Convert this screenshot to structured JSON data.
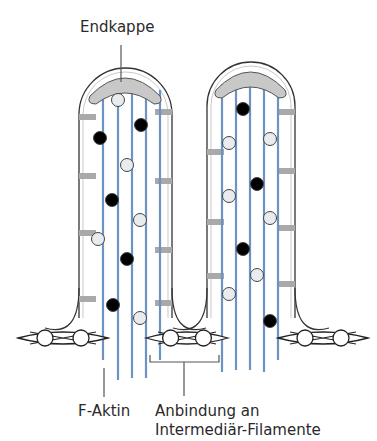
{
  "figure": {
    "type": "Mikrovilli schematic",
    "labels": {
      "top": "Endkappe",
      "bottom_left": "F-Aktin",
      "bottom_right_line1": "Anbindung an",
      "bottom_right_line2": "Intermediär-Filamente"
    }
  },
  "colors": {
    "outline": "#333333",
    "filament": "#6b93c4",
    "crosslink": "#a9a9a9",
    "cap": "#c8c8c8",
    "dot_filled": "#000000",
    "dot_open_fill": "#e8ecef",
    "leader": "#555555"
  },
  "villi": [
    {
      "name": "left-villus",
      "x_left": 79,
      "x_right": 172,
      "top": 68,
      "base": 318,
      "filaments_x": [
        103,
        118,
        132,
        146,
        160
      ],
      "filament_bottom": [
        360,
        380,
        378,
        378,
        360
      ],
      "cap": {
        "x1": 90,
        "x2": 160,
        "y": 82
      },
      "crosslinks": [
        {
          "side": "left",
          "y": 117
        },
        {
          "side": "right",
          "y": 112
        },
        {
          "side": "left",
          "y": 176
        },
        {
          "side": "right",
          "y": 181
        },
        {
          "side": "left",
          "y": 233
        },
        {
          "side": "right",
          "y": 250
        },
        {
          "side": "left",
          "y": 299
        },
        {
          "side": "right",
          "y": 303
        }
      ],
      "dots": [
        {
          "x": 118,
          "y": 100,
          "filled": false
        },
        {
          "x": 141,
          "y": 125,
          "filled": true
        },
        {
          "x": 100,
          "y": 138,
          "filled": true
        },
        {
          "x": 127,
          "y": 165,
          "filled": false
        },
        {
          "x": 112,
          "y": 200,
          "filled": true
        },
        {
          "x": 140,
          "y": 220,
          "filled": false
        },
        {
          "x": 98,
          "y": 239,
          "filled": false
        },
        {
          "x": 127,
          "y": 259,
          "filled": true
        },
        {
          "x": 113,
          "y": 305,
          "filled": true
        },
        {
          "x": 140,
          "y": 318,
          "filled": false
        }
      ]
    },
    {
      "name": "right-villus",
      "x_left": 207,
      "x_right": 295,
      "top": 62,
      "base": 318,
      "filaments_x": [
        222,
        236,
        250,
        264,
        278
      ],
      "filament_bottom": [
        372,
        370,
        370,
        372,
        360
      ],
      "cap": {
        "x1": 216,
        "x2": 285,
        "y": 76
      },
      "crosslinks": [
        {
          "side": "left",
          "y": 152
        },
        {
          "side": "right",
          "y": 112
        },
        {
          "side": "left",
          "y": 222
        },
        {
          "side": "right",
          "y": 171
        },
        {
          "side": "left",
          "y": 276
        },
        {
          "side": "right",
          "y": 228
        },
        {
          "side": "right",
          "y": 284
        }
      ],
      "dots": [
        {
          "x": 243,
          "y": 109,
          "filled": true
        },
        {
          "x": 229,
          "y": 143,
          "filled": false
        },
        {
          "x": 270,
          "y": 139,
          "filled": false
        },
        {
          "x": 257,
          "y": 184,
          "filled": true
        },
        {
          "x": 229,
          "y": 196,
          "filled": false
        },
        {
          "x": 270,
          "y": 218,
          "filled": false
        },
        {
          "x": 243,
          "y": 249,
          "filled": true
        },
        {
          "x": 257,
          "y": 275,
          "filled": false
        },
        {
          "x": 229,
          "y": 294,
          "filled": false
        },
        {
          "x": 270,
          "y": 321,
          "filled": true
        }
      ]
    }
  ],
  "junctions": [
    {
      "name": "left-junction",
      "x": 18,
      "y": 338,
      "width": 90
    },
    {
      "name": "middle-junction",
      "x": 146,
      "y": 338,
      "width": 82
    },
    {
      "name": "right-junction",
      "x": 278,
      "y": 338,
      "width": 90
    }
  ]
}
